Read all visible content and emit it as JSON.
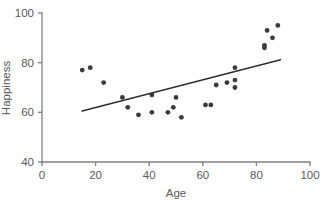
{
  "chart_data": {
    "type": "scatter",
    "title": "",
    "xlabel": "Age",
    "ylabel": "Happiness",
    "xlim": [
      0,
      100
    ],
    "ylim": [
      40,
      100
    ],
    "xticks": [
      0,
      20,
      40,
      60,
      80,
      100
    ],
    "yticks": [
      40,
      60,
      80,
      100
    ],
    "xtick_labels": [
      "0",
      "20",
      "40",
      "60",
      "80",
      "100"
    ],
    "ytick_labels": [
      "40",
      "60",
      "80",
      "100"
    ],
    "grid": false,
    "legend": null,
    "point_color": "#3b3b3f",
    "line_color": "#2e2e33",
    "axis_color": "#808080",
    "text_color": "#58595b",
    "points": [
      {
        "x": 15,
        "y": 77
      },
      {
        "x": 18,
        "y": 78
      },
      {
        "x": 23,
        "y": 72
      },
      {
        "x": 30,
        "y": 66
      },
      {
        "x": 32,
        "y": 62
      },
      {
        "x": 36,
        "y": 59
      },
      {
        "x": 41,
        "y": 67
      },
      {
        "x": 41,
        "y": 60
      },
      {
        "x": 47,
        "y": 60
      },
      {
        "x": 49,
        "y": 62
      },
      {
        "x": 50,
        "y": 66
      },
      {
        "x": 52,
        "y": 58
      },
      {
        "x": 61,
        "y": 63
      },
      {
        "x": 63,
        "y": 63
      },
      {
        "x": 65,
        "y": 71
      },
      {
        "x": 69,
        "y": 72
      },
      {
        "x": 72,
        "y": 73
      },
      {
        "x": 72,
        "y": 78
      },
      {
        "x": 72,
        "y": 70
      },
      {
        "x": 83,
        "y": 86
      },
      {
        "x": 83,
        "y": 87
      },
      {
        "x": 84,
        "y": 93
      },
      {
        "x": 86,
        "y": 90
      },
      {
        "x": 88,
        "y": 95
      }
    ],
    "trendline": {
      "x1": 15,
      "y1": 60.5,
      "x2": 89,
      "y2": 81.2
    }
  }
}
